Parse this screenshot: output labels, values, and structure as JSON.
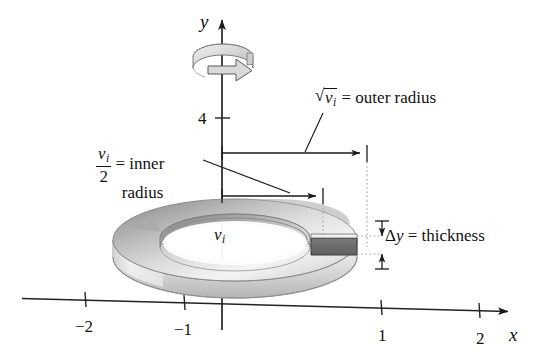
{
  "figure": {
    "kind": "washer-method-solid-of-revolution-diagram",
    "axes": {
      "y_axis_label": "y",
      "x_axis_label": "x",
      "y_ticks": [
        {
          "value": "4",
          "label": "4"
        }
      ],
      "x_ticks": [
        {
          "value": "-2",
          "label": "−2"
        },
        {
          "value": "-1",
          "label": "−1"
        },
        {
          "value": "1",
          "label": "1"
        },
        {
          "value": "2",
          "label": "2"
        }
      ]
    },
    "annotations": {
      "outer_radius": {
        "radical_glyph": "√",
        "variable": "v",
        "subscript": "i",
        "equals": "=",
        "text": "outer radius"
      },
      "inner_radius": {
        "numerator_variable": "v",
        "numerator_subscript": "i",
        "denominator": "2",
        "equals": "=",
        "text_line1": "inner",
        "text_line2": "radius"
      },
      "thickness": {
        "delta": "Δ",
        "variable": "y",
        "equals": "=",
        "text": "thickness"
      },
      "washer_volume": {
        "variable": "v",
        "subscript": "i"
      }
    },
    "colors": {
      "ink": "#111111",
      "axis": "#2b2b2b",
      "washer_top_light": "#f2f2f2",
      "washer_top_shade": "#9a9a9a",
      "washer_side": "#c9c9c9",
      "washer_inner_shade": "#8d8d8d",
      "cross_section_fill": "#6e6e6e",
      "dotted_guide": "#9b9b9b",
      "rotation_arrow_fill": "#d8d8d8"
    }
  }
}
